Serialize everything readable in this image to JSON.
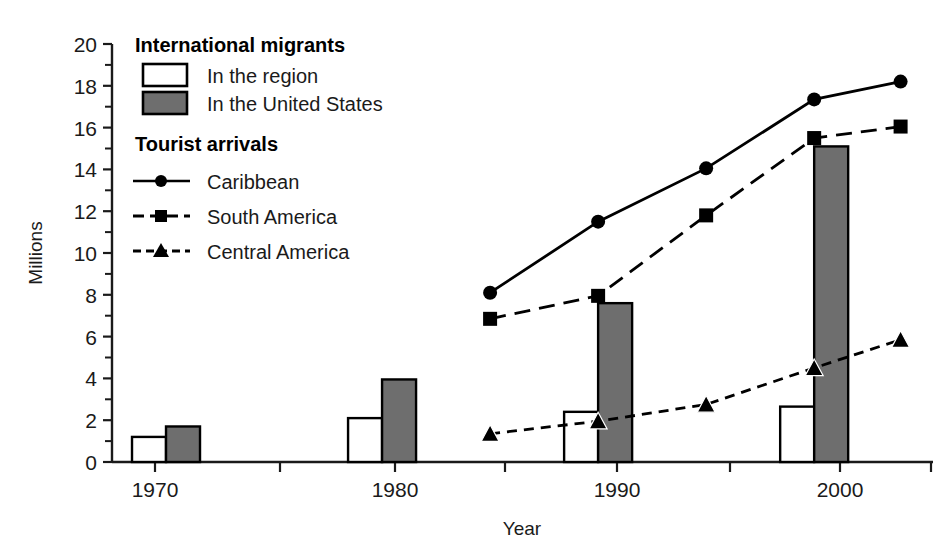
{
  "chart_data": {
    "type": "bar",
    "title": "",
    "xlabel": "Year",
    "ylabel": "Millions",
    "ylim": [
      0,
      20
    ],
    "xlim": [
      1967.5,
      2005.5
    ],
    "y_ticks_major": [
      0,
      2,
      4,
      6,
      8,
      10,
      12,
      14,
      16,
      18,
      20
    ],
    "y_ticks_minor": [
      1,
      3,
      5,
      7,
      9,
      11,
      13,
      15,
      17,
      19
    ],
    "x_ticks": [
      1970,
      1975,
      1980,
      1985,
      1990,
      1995,
      2000
    ],
    "x_tick_labels": [
      "1970",
      "",
      "1980",
      "",
      "1990",
      "",
      "2000"
    ],
    "grid": false,
    "legend_position": "upper-left-inside",
    "units": "Millions",
    "bar_categories": [
      "1970",
      "1980",
      "1990",
      "2000"
    ],
    "bar_series": [
      {
        "name": "In the region",
        "group": "International migrants",
        "fill": "#ffffff",
        "stroke": "#000000",
        "values": [
          1.2,
          2.1,
          2.4,
          2.65
        ]
      },
      {
        "name": "In the United States",
        "group": "International migrants",
        "fill": "#6e6e6e",
        "stroke": "#000000",
        "values": [
          1.7,
          3.95,
          7.6,
          15.1
        ]
      }
    ],
    "line_series": [
      {
        "name": "Caribbean",
        "group": "Tourist arrivals",
        "marker": "circle",
        "dash": "solid",
        "x": [
          1985,
          1990,
          1995,
          2000,
          2004
        ],
        "values": [
          8.1,
          11.5,
          14.05,
          17.35,
          18.2
        ]
      },
      {
        "name": "South America",
        "group": "Tourist arrivals",
        "marker": "square",
        "dash": "long-dash",
        "x": [
          1985,
          1990,
          1995,
          2000,
          2004
        ],
        "values": [
          6.85,
          7.95,
          11.8,
          15.5,
          16.05
        ]
      },
      {
        "name": "Central America",
        "group": "Tourist arrivals",
        "marker": "triangle",
        "dash": "short-dash",
        "x": [
          1985,
          1990,
          1995,
          2000,
          2004
        ],
        "values": [
          1.35,
          1.95,
          2.75,
          4.5,
          5.85
        ]
      }
    ]
  },
  "legend": {
    "heading_migrants": "International migrants",
    "heading_tourists": "Tourist arrivals",
    "item_region": "In the region",
    "item_us": "In the United States",
    "item_caribbean": "Caribbean",
    "item_south_america": "South America",
    "item_central_america": "Central America"
  },
  "axes": {
    "y_label": "Millions",
    "x_label": "Year",
    "y_tick_0": "0",
    "y_tick_2": "2",
    "y_tick_4": "4",
    "y_tick_6": "6",
    "y_tick_8": "8",
    "y_tick_10": "10",
    "y_tick_12": "12",
    "y_tick_14": "14",
    "y_tick_16": "16",
    "y_tick_18": "18",
    "y_tick_20": "20",
    "x_tick_1970": "1970",
    "x_tick_1980": "1980",
    "x_tick_1990": "1990",
    "x_tick_2000": "2000"
  },
  "colors": {
    "bar_white": "#ffffff",
    "bar_gray": "#6e6e6e",
    "line": "#000000",
    "axis": "#1a1a1a",
    "background": "#ffffff"
  }
}
